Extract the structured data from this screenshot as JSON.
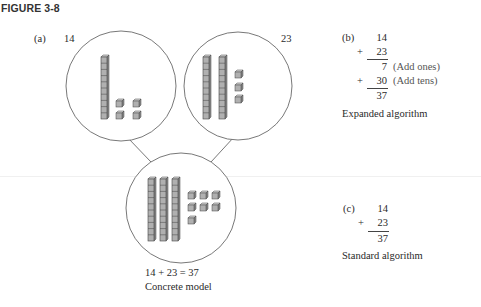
{
  "figure": {
    "title": "FIGURE 3-8"
  },
  "part_a": {
    "label": "(a)",
    "left_number": "14",
    "right_number": "23",
    "caption_equation": "14 + 23 = 37",
    "caption": "Concrete model",
    "models": [
      {
        "name": "fourteen",
        "tens": 1,
        "ones": 4
      },
      {
        "name": "twenty-three",
        "tens": 2,
        "ones": 3
      },
      {
        "name": "thirty-seven",
        "tens": 3,
        "ones": 7
      }
    ]
  },
  "part_b": {
    "label": "(b)",
    "addend1": "14",
    "plus1": "+",
    "addend2": "23",
    "partial1": "7",
    "partial1_note": "(Add ones)",
    "plus2": "+",
    "partial2": "30",
    "partial2_note": "(Add tens)",
    "sum": "37",
    "caption": "Expanded algorithm"
  },
  "part_c": {
    "label": "(c)",
    "addend1": "14",
    "plus": "+",
    "addend2": "23",
    "sum": "37",
    "caption": "Standard algorithm"
  },
  "colors": {
    "cube_fill": "#b0b0b0",
    "cube_top": "#d6d6d6",
    "cube_side": "#8e8e8e",
    "cube_stroke": "#444444",
    "circle_stroke": "#555555"
  }
}
